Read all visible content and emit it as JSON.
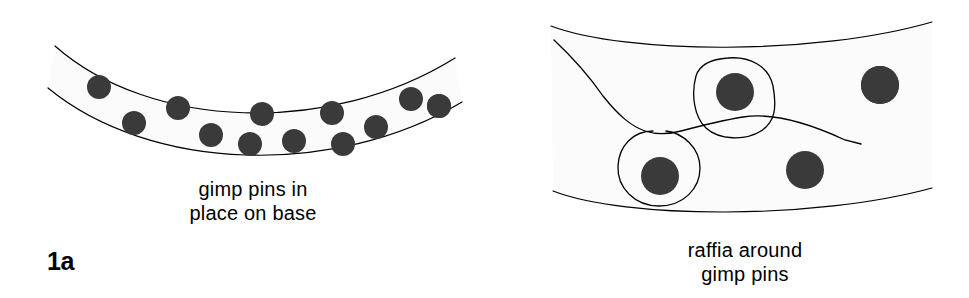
{
  "figure": {
    "background_color": "#ffffff",
    "ink_color": "#000000",
    "pin_fill_color": "#3a3a3a",
    "band_fill_color": "#fbfbfb",
    "width": 969,
    "height": 298
  },
  "panels": [
    {
      "id": "1a",
      "label": "1a",
      "caption_line1": "gimp pins in",
      "caption_line2": "place on base",
      "pin_count": 13,
      "pins": [
        {
          "cx": 70,
          "cy": 94,
          "r": 12
        },
        {
          "cx": 99,
          "cy": 87,
          "r": 12
        },
        {
          "cx": 134,
          "cy": 123,
          "r": 12
        },
        {
          "cx": 178,
          "cy": 108,
          "r": 12
        },
        {
          "cx": 211,
          "cy": 135,
          "r": 12
        },
        {
          "cx": 250,
          "cy": 144,
          "r": 12
        },
        {
          "cx": 262,
          "cy": 114,
          "r": 12
        },
        {
          "cx": 294,
          "cy": 141,
          "r": 12
        },
        {
          "cx": 332,
          "cy": 113,
          "r": 12
        },
        {
          "cx": 343,
          "cy": 144,
          "r": 12
        },
        {
          "cx": 376,
          "cy": 127,
          "r": 12
        },
        {
          "cx": 411,
          "cy": 99,
          "r": 12
        },
        {
          "cx": 439,
          "cy": 106,
          "r": 12
        }
      ]
    },
    {
      "id": "1b",
      "label": "1b",
      "caption_line1": "raffia around",
      "caption_line2": "gimp pins",
      "pin_count": 4,
      "number_labels": [
        {
          "text": "1",
          "x": 45,
          "y": 44
        },
        {
          "text": "3",
          "x": 203,
          "y": 79
        },
        {
          "text": "2",
          "x": 123,
          "y": 179
        },
        {
          "text": "4",
          "x": 280,
          "y": 187
        }
      ],
      "pins": [
        {
          "id": "pin-1",
          "cx": 113,
          "cy": 88,
          "r": 19,
          "wrapped": false
        },
        {
          "id": "pin-2",
          "cx": 175,
          "cy": 176,
          "r": 19,
          "wrapped": true
        },
        {
          "id": "pin-3",
          "cx": 250,
          "cy": 92,
          "r": 19,
          "wrapped": true
        },
        {
          "id": "pin-4",
          "cx": 320,
          "cy": 170,
          "r": 19,
          "wrapped": false
        },
        {
          "id": "pin-5",
          "cx": 395,
          "cy": 85,
          "r": 19,
          "wrapped": false
        }
      ]
    }
  ]
}
